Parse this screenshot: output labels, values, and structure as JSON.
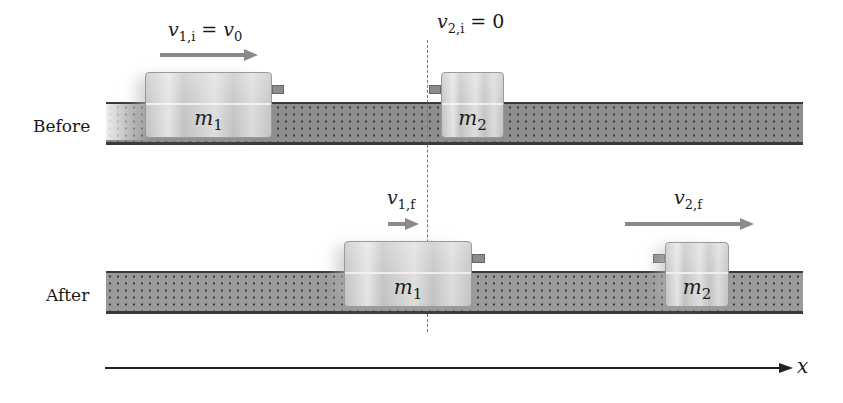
{
  "diagram": {
    "rows": {
      "before": {
        "label": "Before"
      },
      "after": {
        "label": "After"
      }
    },
    "blocks": {
      "before_m1": {
        "symbol": "m",
        "subscript": "1"
      },
      "before_m2": {
        "symbol": "m",
        "subscript": "2"
      },
      "after_m1": {
        "symbol": "m",
        "subscript": "1"
      },
      "after_m2": {
        "symbol": "m",
        "subscript": "2"
      }
    },
    "velocities": {
      "v1i": {
        "symbol": "v",
        "subscript": "1,i",
        "rhs_prefix": " = ",
        "rhs_symbol": "v",
        "rhs_subscript": "0"
      },
      "v2i": {
        "symbol": "v",
        "subscript": "2,i",
        "rhs_prefix": " = ",
        "rhs_value": "0"
      },
      "v1f": {
        "symbol": "v",
        "subscript": "1,f"
      },
      "v2f": {
        "symbol": "v",
        "subscript": "2,f"
      }
    },
    "axis": {
      "label": "x"
    },
    "colors": {
      "track": "#8e8e8e",
      "track_border": "#3a3a3a",
      "block": "#c8c8c8",
      "arrow": "#8a8a8a",
      "axis": "#222222"
    }
  }
}
